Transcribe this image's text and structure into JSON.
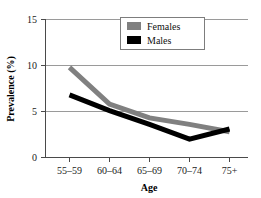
{
  "chart_data": {
    "type": "line",
    "title": "",
    "xlabel": "Age",
    "ylabel": "Prevalence (%)",
    "categories": [
      "55–59",
      "60–64",
      "65–69",
      "70–74",
      "75+"
    ],
    "series": [
      {
        "name": "Females",
        "color": "#808080",
        "values": [
          9.8,
          5.8,
          4.3,
          3.6,
          2.8
        ]
      },
      {
        "name": "Males",
        "color": "#000000",
        "values": [
          6.8,
          5.1,
          3.6,
          2.0,
          3.1
        ]
      }
    ],
    "ylim": [
      0,
      15
    ],
    "yticks": [
      0,
      5,
      10,
      15
    ],
    "ytick_labels": [
      "0",
      "5",
      "10",
      "15"
    ],
    "grid": true,
    "grid_axis": "y",
    "legend_position": "top-center"
  },
  "axis": {
    "y_title": "Prevalence (%)",
    "x_title": "Age",
    "y_tick_0": "0",
    "y_tick_1": "5",
    "y_tick_2": "10",
    "y_tick_3": "15",
    "x_tick_0": "55–59",
    "x_tick_1": "60–64",
    "x_tick_2": "65–69",
    "x_tick_3": "70–74",
    "x_tick_4": "75+"
  },
  "legend": {
    "entry_0_label": "Females",
    "entry_1_label": "Males"
  },
  "colors": {
    "females": "#808080",
    "males": "#000000",
    "grid": "#9a9a9a",
    "axis": "#4a4a4a",
    "background": "#ffffff"
  }
}
